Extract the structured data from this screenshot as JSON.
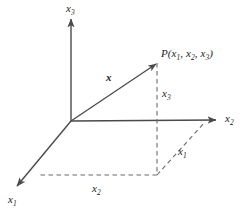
{
  "figure": {
    "kind": "3d-cartesian-coordinate-vector-diagram",
    "background_color": "#ffffff",
    "line_color": "#4a4a4a",
    "text_color": "#1d1d1d",
    "width": 248,
    "height": 215
  },
  "axes": [
    {
      "id": "x1",
      "name": "x1-axis",
      "label_base": "x",
      "label_sub": "1",
      "style": "solid",
      "arrow": "end",
      "from": [
        71,
        121
      ],
      "to": [
        16,
        187
      ],
      "label_pos": [
        8,
        194
      ]
    },
    {
      "id": "x2",
      "name": "x2-axis",
      "label_base": "x",
      "label_sub": "2",
      "style": "solid",
      "arrow": "end",
      "from": [
        71,
        121
      ],
      "to": [
        216,
        120
      ],
      "label_pos": [
        225,
        113
      ]
    },
    {
      "id": "x3",
      "name": "x3-axis",
      "label_base": "x",
      "label_sub": "3",
      "style": "solid",
      "arrow": "end",
      "from": [
        71,
        121
      ],
      "to": [
        71,
        19
      ],
      "label_pos": [
        66,
        3
      ]
    }
  ],
  "vector": {
    "id": "x",
    "name": "position-vector-x",
    "label_base": "x",
    "label_sub": "",
    "bold": true,
    "style": "solid",
    "arrow": "end",
    "from": [
      71,
      121
    ],
    "to": [
      157,
      63
    ],
    "label_pos": [
      106,
      72
    ]
  },
  "point": {
    "id": "P",
    "name": "point-P",
    "text_prefix": "P",
    "text_open": "(",
    "components": [
      {
        "base": "x",
        "sub": "1"
      },
      {
        "base": "x",
        "sub": "2"
      },
      {
        "base": "x",
        "sub": "3"
      }
    ],
    "separator": ", ",
    "text_close": ")",
    "coords": [
      157,
      63
    ],
    "label_pos": [
      161,
      48
    ]
  },
  "projection_lines": [
    {
      "id": "drop-from-P",
      "name": "dashed-drop-line-from-P",
      "style": "dashed",
      "from": [
        157,
        63
      ],
      "to": [
        157,
        175
      ]
    },
    {
      "id": "base-to-x1-axis",
      "name": "dashed-line-to-x1-axis",
      "style": "dashed",
      "from": [
        157,
        175
      ],
      "to": [
        38,
        175
      ]
    },
    {
      "id": "base-to-x2-axis",
      "name": "dashed-line-to-x2-axis",
      "style": "dashed",
      "from": [
        157,
        175
      ],
      "to": [
        205,
        122
      ]
    }
  ],
  "component_labels": [
    {
      "id": "x3-component",
      "name": "component-label-x3",
      "base": "x",
      "sub": "3",
      "pos": [
        162,
        88
      ]
    },
    {
      "id": "x1-component",
      "name": "component-label-x1",
      "base": "x",
      "sub": "1",
      "pos": [
        178,
        146
      ]
    },
    {
      "id": "x2-component",
      "name": "component-label-x2",
      "base": "x",
      "sub": "2",
      "pos": [
        92,
        183
      ]
    }
  ]
}
